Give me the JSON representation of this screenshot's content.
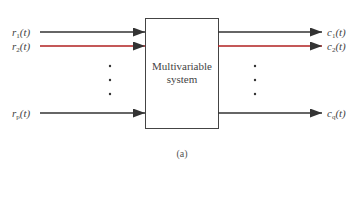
{
  "diagram": {
    "title_box": {
      "line1": "Multivariable",
      "line2": "system"
    },
    "inputs": [
      {
        "name": "r",
        "sub": "1",
        "arg": "(t)",
        "color": "#333333",
        "y": 32
      },
      {
        "name": "r",
        "sub": "2",
        "arg": "(t)",
        "color": "#b02020",
        "y": 46
      },
      {
        "name": "r",
        "sub": "p",
        "arg": "(t)",
        "color": "#333333",
        "y": 113
      }
    ],
    "outputs": [
      {
        "name": "c",
        "sub": "1",
        "arg": "(t)",
        "color": "#333333",
        "y": 32
      },
      {
        "name": "c",
        "sub": "2",
        "arg": "(t)",
        "color": "#b02020",
        "y": 46
      },
      {
        "name": "c",
        "sub": "q",
        "arg": "(t)",
        "color": "#333333",
        "y": 113
      }
    ],
    "ellipsis": "⋮",
    "caption": "(a)"
  }
}
